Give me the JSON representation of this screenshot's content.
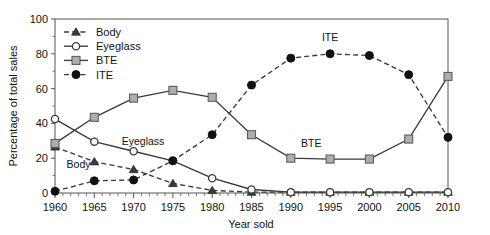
{
  "chart_data": {
    "type": "line",
    "title": "",
    "xlabel": "Year sold",
    "ylabel": "Percentage of total sales",
    "xlim": [
      1960,
      2010
    ],
    "ylim": [
      0,
      100
    ],
    "xticks": [
      1960,
      1965,
      1970,
      1975,
      1980,
      1985,
      1990,
      1995,
      2000,
      2005,
      2010
    ],
    "yticks": [
      0,
      20,
      40,
      60,
      80,
      100
    ],
    "minor_tick_interval": 1,
    "grid": false,
    "legend_position": "upper-left-inside",
    "x": [
      1960,
      1965,
      1970,
      1975,
      1980,
      1985,
      1990,
      1995,
      2000,
      2005,
      2010
    ],
    "series": [
      {
        "name": "Body",
        "values": [
          26.5,
          18.0,
          13.5,
          5.5,
          1.5,
          0.5,
          0.5,
          0.5,
          0.5,
          0.5,
          0.5
        ],
        "line_style": "dashed",
        "marker": "filled-triangle",
        "color": "#3a3a3a"
      },
      {
        "name": "Eyeglass",
        "values": [
          42.5,
          29.5,
          24.0,
          18.5,
          8.5,
          2.0,
          0.5,
          0.5,
          0.5,
          0.5,
          0.5
        ],
        "line_style": "solid",
        "marker": "open-circle",
        "color": "#3a3a3a"
      },
      {
        "name": "BTE",
        "values": [
          28.5,
          43.5,
          54.5,
          59.0,
          55.0,
          33.5,
          20.0,
          19.5,
          19.5,
          31.0,
          67.0
        ],
        "line_style": "solid",
        "marker": "gray-square",
        "color": "#aeaeae"
      },
      {
        "name": "ITE",
        "values": [
          1.0,
          7.0,
          7.5,
          18.5,
          33.5,
          62.0,
          77.5,
          80.0,
          79.0,
          68.0,
          32.0
        ],
        "line_style": "dashed",
        "marker": "filled-circle",
        "color": "#111111"
      }
    ],
    "annotations": [
      {
        "text": "Eyeglass",
        "x": 1971.2,
        "y": 27.5
      },
      {
        "text": "Body",
        "x": 1963.0,
        "y": 14.5
      },
      {
        "text": "BTE",
        "x": 1992.6,
        "y": 26.5
      },
      {
        "text": "ITE",
        "x": 1995.0,
        "y": 87.5
      }
    ],
    "legend_entries": [
      {
        "label": "Body",
        "marker": "filled-triangle",
        "line_style": "dashed"
      },
      {
        "label": "Eyeglass",
        "marker": "open-circle",
        "line_style": "solid"
      },
      {
        "label": "BTE",
        "marker": "gray-square",
        "line_style": "solid"
      },
      {
        "label": "ITE",
        "marker": "filled-circle",
        "line_style": "dashed"
      }
    ]
  },
  "colors": {
    "axis": "#555555",
    "text": "#111111",
    "dark_line": "#3a3a3a",
    "square_fill": "#aeaeae",
    "background": "#ffffff"
  }
}
